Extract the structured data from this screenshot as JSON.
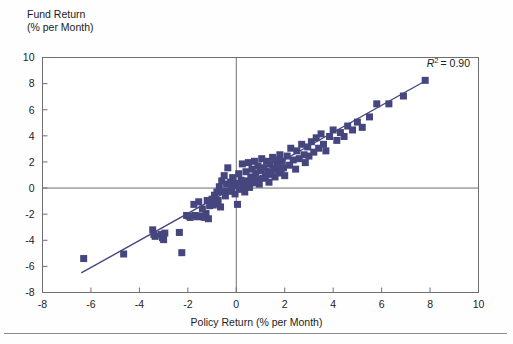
{
  "chart_data": {
    "type": "scatter",
    "title": "",
    "ylabel": "Fund Return\n(% per Month)",
    "ylabel_line1": "Fund Return",
    "ylabel_line2": "(% per Month)",
    "xlabel": "Policy Return (% per Month)",
    "xlim": [
      -8,
      10
    ],
    "ylim": [
      -8,
      10
    ],
    "xticks": [
      -8,
      -6,
      -4,
      -2,
      0,
      2,
      4,
      6,
      8,
      10
    ],
    "yticks": [
      -8,
      -6,
      -4,
      -2,
      0,
      2,
      4,
      6,
      8,
      10
    ],
    "grid": false,
    "legend": "none",
    "annotations": [
      {
        "text": "R2 = 0.90",
        "r_symbol": "R",
        "exponent": "2",
        "value": "= 0.90",
        "x": 7.4,
        "y": 9.3
      }
    ],
    "marker": {
      "shape": "square",
      "size_px": 7,
      "color": "#46467f"
    },
    "trendline": {
      "type": "linear",
      "color": "#46467f",
      "x_start": -6.4,
      "y_start": -6.5,
      "x_end": 7.8,
      "y_end": 8.2,
      "slope": 1.035,
      "intercept": 0.12
    },
    "r_squared": 0.9,
    "n_points": 120,
    "points": [
      [
        -6.3,
        -5.4
      ],
      [
        -4.65,
        -5.05
      ],
      [
        -3.45,
        -3.2
      ],
      [
        -3.4,
        -3.55
      ],
      [
        -3.35,
        -3.7
      ],
      [
        -3.1,
        -3.55
      ],
      [
        -3.05,
        -3.8
      ],
      [
        -3.0,
        -3.95
      ],
      [
        -2.95,
        -3.45
      ],
      [
        -2.35,
        -3.4
      ],
      [
        -2.25,
        -4.95
      ],
      [
        -2.05,
        -2.1
      ],
      [
        -1.95,
        -2.15
      ],
      [
        -1.9,
        -2.25
      ],
      [
        -1.75,
        -1.25
      ],
      [
        -1.7,
        -2.1
      ],
      [
        -1.6,
        -2.2
      ],
      [
        -1.55,
        -1.05
      ],
      [
        -1.45,
        -2.15
      ],
      [
        -1.4,
        -1.6
      ],
      [
        -1.35,
        -2.2
      ],
      [
        -1.3,
        -2.25
      ],
      [
        -1.25,
        -1.95
      ],
      [
        -1.2,
        -0.95
      ],
      [
        -1.15,
        -2.35
      ],
      [
        -1.1,
        -1.35
      ],
      [
        -1.0,
        -0.85
      ],
      [
        -0.95,
        -1.3
      ],
      [
        -0.9,
        -0.55
      ],
      [
        -0.85,
        -1.2
      ],
      [
        -0.8,
        -0.3
      ],
      [
        -0.75,
        -0.95
      ],
      [
        -0.7,
        0.1
      ],
      [
        -0.65,
        -1.45
      ],
      [
        -0.6,
        0.55
      ],
      [
        -0.55,
        -0.25
      ],
      [
        -0.5,
        0.95
      ],
      [
        -0.45,
        -0.6
      ],
      [
        -0.4,
        0.3
      ],
      [
        -0.35,
        1.55
      ],
      [
        -0.3,
        -0.25
      ],
      [
        -0.25,
        0.45
      ],
      [
        -0.2,
        -0.05
      ],
      [
        -0.15,
        0.8
      ],
      [
        -0.1,
        0.15
      ],
      [
        -0.05,
        -0.45
      ],
      [
        0.0,
        0.35
      ],
      [
        0.05,
        -1.25
      ],
      [
        0.1,
        1.1
      ],
      [
        0.15,
        -0.1
      ],
      [
        0.2,
        0.6
      ],
      [
        0.25,
        1.85
      ],
      [
        0.3,
        0.2
      ],
      [
        0.35,
        -0.3
      ],
      [
        0.4,
        1.25
      ],
      [
        0.45,
        0.55
      ],
      [
        0.5,
        1.95
      ],
      [
        0.55,
        0.05
      ],
      [
        0.6,
        0.85
      ],
      [
        0.65,
        1.45
      ],
      [
        0.7,
        0.4
      ],
      [
        0.75,
        2.05
      ],
      [
        0.8,
        1.15
      ],
      [
        0.85,
        0.65
      ],
      [
        0.9,
        1.7
      ],
      [
        0.95,
        0.3
      ],
      [
        1.0,
        1.35
      ],
      [
        1.05,
        2.25
      ],
      [
        1.1,
        0.75
      ],
      [
        1.15,
        1.55
      ],
      [
        1.2,
        0.95
      ],
      [
        1.25,
        2.05
      ],
      [
        1.3,
        1.25
      ],
      [
        1.35,
        0.45
      ],
      [
        1.4,
        1.85
      ],
      [
        1.45,
        1.05
      ],
      [
        1.5,
        2.35
      ],
      [
        1.55,
        1.45
      ],
      [
        1.6,
        0.85
      ],
      [
        1.65,
        2.15
      ],
      [
        1.7,
        1.65
      ],
      [
        1.75,
        1.15
      ],
      [
        1.8,
        2.55
      ],
      [
        1.85,
        1.35
      ],
      [
        1.9,
        2.05
      ],
      [
        1.95,
        1.55
      ],
      [
        2.0,
        0.95
      ],
      [
        2.1,
        2.45
      ],
      [
        2.2,
        1.75
      ],
      [
        2.25,
        3.05
      ],
      [
        2.35,
        2.15
      ],
      [
        2.45,
        1.45
      ],
      [
        2.5,
        2.85
      ],
      [
        2.6,
        2.25
      ],
      [
        2.7,
        3.35
      ],
      [
        2.8,
        2.55
      ],
      [
        2.85,
        1.95
      ],
      [
        2.95,
        3.15
      ],
      [
        3.0,
        2.45
      ],
      [
        3.1,
        3.55
      ],
      [
        3.2,
        2.75
      ],
      [
        3.3,
        3.85
      ],
      [
        3.4,
        3.05
      ],
      [
        3.5,
        4.15
      ],
      [
        3.6,
        3.35
      ],
      [
        3.7,
        2.85
      ],
      [
        3.85,
        3.95
      ],
      [
        4.0,
        4.45
      ],
      [
        4.15,
        3.65
      ],
      [
        4.3,
        4.25
      ],
      [
        4.45,
        3.95
      ],
      [
        4.6,
        4.75
      ],
      [
        4.8,
        4.45
      ],
      [
        5.0,
        5.05
      ],
      [
        5.2,
        4.65
      ],
      [
        5.5,
        5.45
      ],
      [
        5.8,
        6.45
      ],
      [
        6.3,
        6.45
      ],
      [
        6.9,
        7.05
      ],
      [
        7.8,
        8.25
      ]
    ]
  }
}
